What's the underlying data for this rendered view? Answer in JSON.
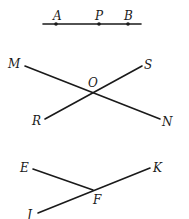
{
  "figures": [
    {
      "name": "segment-apb",
      "description": "Line segment with points A, P, B",
      "labels": {
        "A": "A",
        "P": "P",
        "B": "B"
      }
    },
    {
      "name": "intersecting-lines-mn-rs",
      "description": "Lines MN and RS intersecting at O",
      "labels": {
        "M": "M",
        "S": "S",
        "O": "O",
        "R": "R",
        "N": "N"
      }
    },
    {
      "name": "rays-ef-jk",
      "description": "Segment EF meeting segment JK at F",
      "labels": {
        "E": "E",
        "K": "K",
        "F": "F",
        "J": "J"
      }
    }
  ]
}
